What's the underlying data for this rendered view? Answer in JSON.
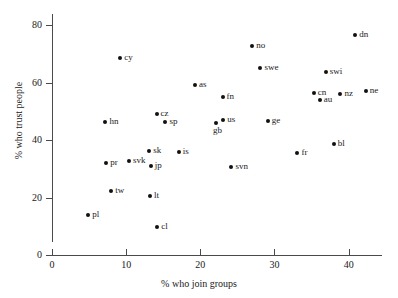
{
  "chart_data": {
    "type": "scatter",
    "title": "",
    "xlabel": "% who join groups",
    "ylabel": "% who trust people",
    "xlim": [
      0,
      44.5
    ],
    "ylim": [
      0,
      84
    ],
    "xticks": [
      0,
      10,
      20,
      30,
      40
    ],
    "yticks": [
      0,
      20,
      40,
      60,
      80
    ],
    "xtick_labels": [
      "0",
      "10",
      "20",
      "30",
      "40"
    ],
    "ytick_labels": [
      "0",
      "20",
      "40",
      "60",
      "80"
    ],
    "grid": false,
    "legend": "none",
    "marker_color": "#111111",
    "axis_color": "#4a4a4a",
    "points": [
      {
        "label": "pl",
        "x": 4.9,
        "y": 14.0,
        "label_pos": "right"
      },
      {
        "label": "hn",
        "x": 7.2,
        "y": 46.2,
        "label_pos": "right"
      },
      {
        "label": "pr",
        "x": 7.3,
        "y": 32.1,
        "label_pos": "right"
      },
      {
        "label": "tw",
        "x": 8.0,
        "y": 22.4,
        "label_pos": "right"
      },
      {
        "label": "cy",
        "x": 9.2,
        "y": 68.7,
        "label_pos": "right"
      },
      {
        "label": "svk",
        "x": 10.4,
        "y": 32.8,
        "label_pos": "right"
      },
      {
        "label": "sk",
        "x": 13.1,
        "y": 36.3,
        "label_pos": "right"
      },
      {
        "label": "jp",
        "x": 13.3,
        "y": 31.0,
        "label_pos": "right"
      },
      {
        "label": "lt",
        "x": 13.2,
        "y": 20.5,
        "label_pos": "right"
      },
      {
        "label": "cz",
        "x": 14.1,
        "y": 49.3,
        "label_pos": "right"
      },
      {
        "label": "cl",
        "x": 14.2,
        "y": 9.8,
        "label_pos": "right"
      },
      {
        "label": "sp",
        "x": 15.3,
        "y": 46.2,
        "label_pos": "right"
      },
      {
        "label": "is",
        "x": 17.1,
        "y": 35.9,
        "label_pos": "right"
      },
      {
        "label": "as",
        "x": 19.3,
        "y": 59.4,
        "label_pos": "right"
      },
      {
        "label": "gb",
        "x": 22.1,
        "y": 45.9,
        "label_pos": "below"
      },
      {
        "label": "us",
        "x": 23.1,
        "y": 47.0,
        "label_pos": "right"
      },
      {
        "label": "fn",
        "x": 23.0,
        "y": 55.2,
        "label_pos": "right"
      },
      {
        "label": "svn",
        "x": 24.2,
        "y": 30.6,
        "label_pos": "right"
      },
      {
        "label": "no",
        "x": 27.0,
        "y": 72.8,
        "label_pos": "right"
      },
      {
        "label": "swe",
        "x": 28.1,
        "y": 65.3,
        "label_pos": "right"
      },
      {
        "label": "ge",
        "x": 29.1,
        "y": 46.7,
        "label_pos": "right"
      },
      {
        "label": "fr",
        "x": 33.1,
        "y": 35.6,
        "label_pos": "right"
      },
      {
        "label": "cn",
        "x": 35.3,
        "y": 56.3,
        "label_pos": "right"
      },
      {
        "label": "au",
        "x": 36.1,
        "y": 54.0,
        "label_pos": "right"
      },
      {
        "label": "swi",
        "x": 36.9,
        "y": 63.7,
        "label_pos": "right"
      },
      {
        "label": "bl",
        "x": 38.0,
        "y": 38.6,
        "label_pos": "right"
      },
      {
        "label": "nz",
        "x": 38.9,
        "y": 56.2,
        "label_pos": "right"
      },
      {
        "label": "dn",
        "x": 40.9,
        "y": 76.7,
        "label_pos": "right"
      },
      {
        "label": "ne",
        "x": 42.3,
        "y": 57.2,
        "label_pos": "right"
      }
    ]
  }
}
